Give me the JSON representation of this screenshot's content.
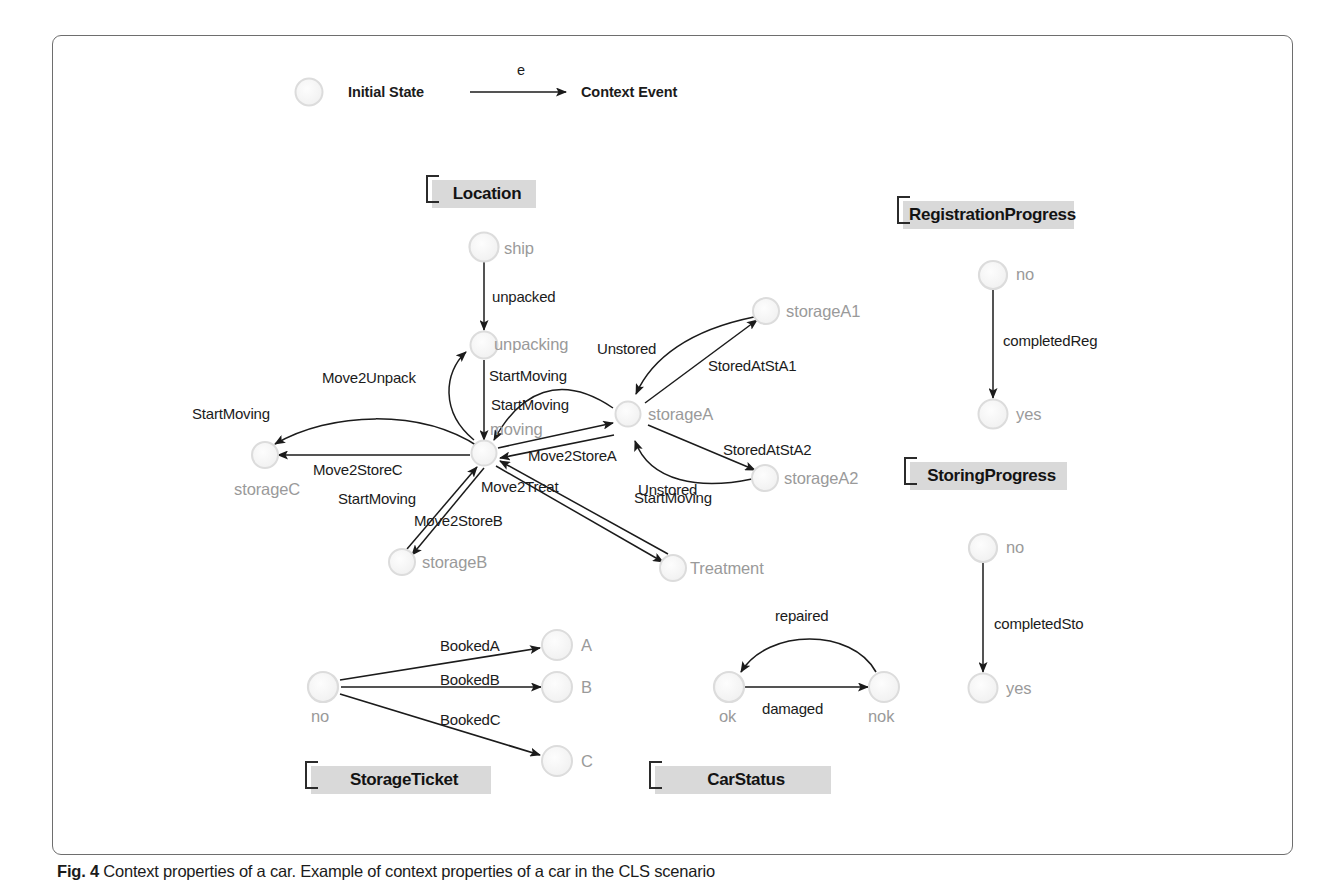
{
  "figure": {
    "caption_label": "Fig. 4",
    "caption_text": " Context properties of a car. Example of context properties of a car in the CLS scenario"
  },
  "legend": {
    "initial_state_label": "Initial State",
    "event_arrow_label": "e",
    "context_event_label": "Context Event"
  },
  "groups": [
    {
      "id": "location",
      "label": "Location"
    },
    {
      "id": "registration_progress",
      "label": "RegistrationProgress"
    },
    {
      "id": "storing_progress",
      "label": "StoringProgress"
    },
    {
      "id": "storage_ticket",
      "label": "StorageTicket"
    },
    {
      "id": "car_status",
      "label": "CarStatus"
    }
  ],
  "nodes": {
    "ship": "ship",
    "unpacking": "unpacking",
    "moving": "moving",
    "storageA": "storageA",
    "storageA1": "storageA1",
    "storageA2": "storageA2",
    "storageB": "storageB",
    "storageC": "storageC",
    "treatment": "Treatment",
    "reg_no": "no",
    "reg_yes": "yes",
    "sto_no": "no",
    "sto_yes": "yes",
    "ticket_no": "no",
    "ticket_A": "A",
    "ticket_B": "B",
    "ticket_C": "C",
    "status_ok": "ok",
    "status_nok": "nok"
  },
  "edges": {
    "unpacked": "unpacked",
    "startmoving_unpacking_moving": "StartMoving",
    "move2unpack": "Move2Unpack",
    "startmoving_storagec_moving": "StartMoving",
    "move2storec": "Move2StoreC",
    "startmoving_storagea_moving": "StartMoving",
    "move2storea": "Move2StoreA",
    "startmoving_storageb_moving": "StartMoving",
    "move2storeb": "Move2StoreB",
    "move2treat": "Move2Treat",
    "startmoving_treatment_moving": "StartMoving",
    "unstored_a1": "Unstored",
    "storedatsta1": "StoredAtStA1",
    "unstored_a2": "Unstored",
    "storedatsta2": "StoredAtStA2",
    "completedreg": "completedReg",
    "completedsto": "completedSto",
    "bookeda": "BookedA",
    "bookedb": "BookedB",
    "bookedc": "BookedC",
    "repaired": "repaired",
    "damaged": "damaged"
  },
  "colors": {
    "node_fill": "#f7f7f7",
    "node_stroke": "#cfcfcf",
    "node_label": "#9a9a9a",
    "edge_stroke": "#2b2b2b",
    "group_box": "#d9d9d9",
    "frame": "#6e6e6e"
  }
}
